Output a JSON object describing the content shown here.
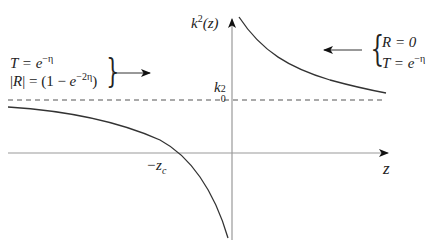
{
  "header": {
    "cut_caption": "~~~ ~~~~~ ~~~~ ~~~ ~~~~~"
  },
  "diagram": {
    "y_axis_label": {
      "base": "k",
      "sup": "2",
      "rest": "(z)"
    },
    "x_axis_label": "z",
    "k0_label": {
      "base": "k",
      "sup": "2",
      "sub": "0"
    },
    "zc_label": {
      "base": "−z",
      "sub": "c"
    },
    "left_annotation": {
      "line1": "T = e",
      "line1_sup": "−η",
      "line2": "|R| = (1 − e",
      "line2_sup": "−2η",
      "line2_end": ")",
      "brace": "}",
      "arrow_direction": "right"
    },
    "right_annotation": {
      "brace": "{",
      "line1": "R = 0",
      "line2": "T = e",
      "line2_sup": "−η",
      "arrow_direction": "left"
    },
    "colors": {
      "curve": "#333333",
      "axis": "#999999",
      "dashed": "#555555",
      "arrow": "#111111"
    }
  }
}
